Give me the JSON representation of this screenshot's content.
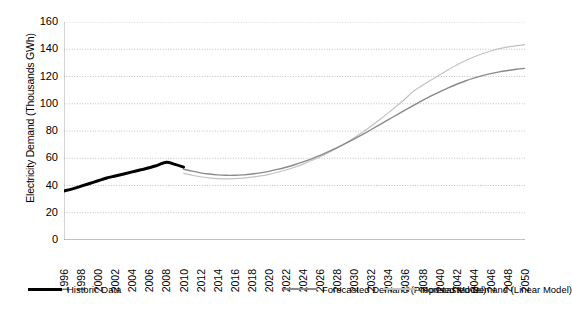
{
  "chart_data": {
    "type": "line",
    "title": "",
    "xlabel": "",
    "ylabel": "Electricity Demand (Thousands GWh)",
    "ylim": [
      0,
      160
    ],
    "ytick_step": 20,
    "yticks": [
      160,
      140,
      120,
      100,
      80,
      60,
      40,
      20,
      0
    ],
    "xlim": [
      1996,
      2050
    ],
    "xtick_step": 2,
    "xticks": [
      1996,
      1998,
      2000,
      2002,
      2004,
      2006,
      2008,
      2010,
      2012,
      2014,
      2016,
      2018,
      2020,
      2022,
      2024,
      2026,
      2028,
      2030,
      2032,
      2034,
      2036,
      2038,
      2040,
      2042,
      2044,
      2046,
      2048,
      2050
    ],
    "grid": true,
    "grid_axis": "y",
    "grid_style": "dotted",
    "legend_position": "bottom",
    "series": [
      {
        "name": "Historic Data",
        "color": "#000000",
        "width": 3.0,
        "x": [
          1996,
          1997,
          1998,
          1999,
          2000,
          2001,
          2002,
          2003,
          2004,
          2005,
          2006,
          2007,
          2008,
          2009,
          2010
        ],
        "values": [
          36.0,
          37.5,
          39.5,
          41.5,
          43.5,
          45.5,
          47.0,
          48.5,
          50.0,
          51.5,
          53.0,
          55.0,
          57.0,
          55.5,
          53.5
        ]
      },
      {
        "name": "Forecasted Demand (Proposed Model)",
        "color": "#8a8a8a",
        "width": 1.4,
        "x": [
          2010,
          2011,
          2012,
          2013,
          2014,
          2015,
          2016,
          2017,
          2018,
          2019,
          2020,
          2021,
          2022,
          2023,
          2024,
          2025,
          2026,
          2027,
          2028,
          2029,
          2030,
          2031,
          2032,
          2033,
          2034,
          2035,
          2036,
          2037,
          2038,
          2039,
          2040,
          2041,
          2042,
          2043,
          2044,
          2045,
          2046,
          2047,
          2048,
          2049,
          2050
        ],
        "values": [
          52.0,
          50.5,
          49.3,
          48.4,
          47.8,
          47.5,
          47.5,
          47.8,
          48.4,
          49.3,
          50.4,
          51.8,
          53.4,
          55.2,
          57.3,
          59.6,
          62.1,
          64.9,
          67.8,
          70.9,
          74.2,
          77.6,
          81.1,
          84.7,
          88.3,
          91.9,
          95.5,
          99.0,
          102.4,
          105.7,
          108.8,
          111.7,
          114.3,
          116.7,
          118.8,
          120.6,
          122.1,
          123.4,
          124.4,
          125.3,
          126.0
        ]
      },
      {
        "name": "Forecasted Demand  (Linear Model)",
        "color": "#c2c2c2",
        "width": 1.2,
        "x": [
          2010,
          2011,
          2012,
          2013,
          2014,
          2015,
          2016,
          2017,
          2018,
          2019,
          2020,
          2021,
          2022,
          2023,
          2024,
          2025,
          2026,
          2027,
          2028,
          2029,
          2030,
          2031,
          2032,
          2033,
          2034,
          2035,
          2036,
          2037,
          2038,
          2039,
          2040,
          2041,
          2042,
          2043,
          2044,
          2045,
          2046,
          2047,
          2048,
          2049,
          2050
        ],
        "values": [
          49.0,
          47.5,
          46.4,
          45.6,
          45.1,
          44.9,
          45.0,
          45.4,
          46.1,
          47.0,
          48.2,
          49.7,
          51.4,
          53.4,
          55.7,
          58.3,
          61.1,
          64.2,
          67.6,
          71.2,
          75.1,
          79.3,
          83.7,
          88.4,
          93.3,
          98.5,
          103.9,
          109.5,
          113.5,
          117.4,
          121.2,
          124.9,
          128.4,
          131.5,
          134.3,
          136.7,
          138.7,
          140.4,
          141.7,
          142.7,
          143.4
        ]
      }
    ],
    "legend_entries": [
      {
        "label": "Historic Data",
        "color": "#000000"
      },
      {
        "label": "Forecasted Demand (Proposed Model)",
        "color": "#8a8a8a"
      },
      {
        "label": "Forecasted Demand  (Linear Model)",
        "color": "#c2c2c2"
      }
    ]
  }
}
